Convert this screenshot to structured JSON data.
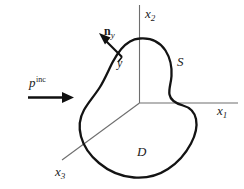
{
  "figure": {
    "type": "scattering-geometry-diagram",
    "background_color": "#ffffff",
    "axis_color": "#6e6e6e",
    "curve_color": "#1a1a1a",
    "width": 244,
    "height": 189
  },
  "axes": {
    "x1": {
      "label": "x",
      "subscript": "1"
    },
    "x2": {
      "label": "x",
      "subscript": "2"
    },
    "x3": {
      "label": "x",
      "subscript": "3"
    }
  },
  "labels": {
    "incident_field": {
      "symbol": "p",
      "superscript": "inc"
    },
    "normal_vector": {
      "symbol": "n",
      "subscript": "y"
    },
    "surface_point": "y",
    "surface": "S",
    "domain": "D"
  }
}
